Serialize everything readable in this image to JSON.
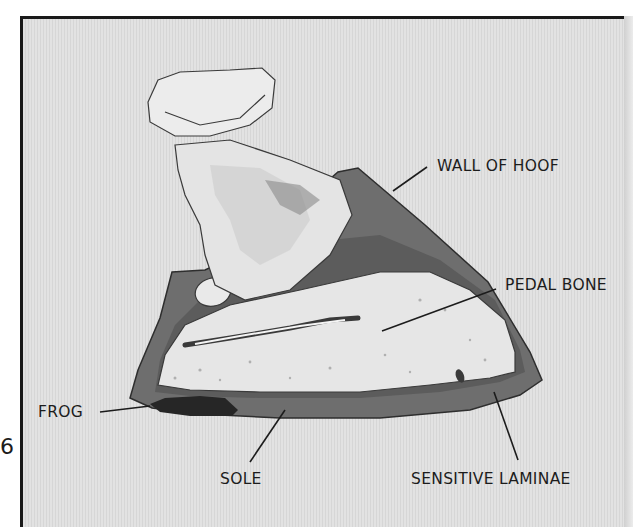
{
  "page": {
    "page_number": "6"
  },
  "diagram": {
    "labels": {
      "wall_of_hoof": "WALL OF HOOF",
      "pedal_bone": "PEDAL BONE",
      "frog": "FROG",
      "sole": "SOLE",
      "sensitive_laminae": "SENSITIVE LAMINAE"
    }
  },
  "colors": {
    "background": "#dedede",
    "frame_border": "#1a1a1a",
    "hoof_wall": "#6e6e6e",
    "bone": "#ececec",
    "frog": "#2a2a2a",
    "text": "#1c1c1c"
  }
}
